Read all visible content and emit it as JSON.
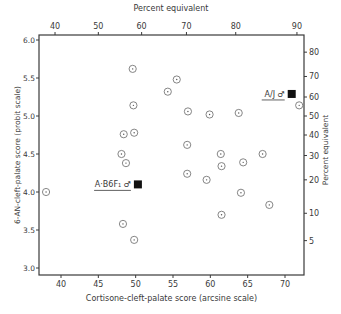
{
  "chart_data": {
    "type": "scatter",
    "title": "",
    "xlabel": "Cortisone-cleft-palate score (arcsine scale)",
    "ylabel": "6-AN-cleft-palate score (probit scale)",
    "top_xlabel": "Percent equivalent",
    "right_ylabel": "Percent equivalent",
    "xlim": [
      37,
      73
    ],
    "ylim": [
      2.9,
      6.1
    ],
    "x_ticks": [
      40,
      45,
      50,
      55,
      60,
      65,
      70
    ],
    "x_tick_labels": [
      "40",
      "45",
      "50",
      "55",
      "60",
      "65",
      "70"
    ],
    "y_ticks": [
      3.0,
      3.5,
      4.0,
      4.5,
      5.0,
      5.5,
      6.0
    ],
    "y_tick_labels": [
      "3.0",
      "3.5",
      "4.0",
      "4.5",
      "5.0",
      "5.5",
      "6.0"
    ],
    "top_ticks": [
      {
        "label": "40",
        "x": 39.2
      },
      {
        "label": "50",
        "x": 45.0
      },
      {
        "label": "60",
        "x": 50.8
      },
      {
        "label": "70",
        "x": 56.8
      },
      {
        "label": "80",
        "x": 63.4
      },
      {
        "label": "90",
        "x": 71.6
      }
    ],
    "right_ticks": [
      {
        "label": "80",
        "y": 5.84
      },
      {
        "label": "70",
        "y": 5.52
      },
      {
        "label": "60",
        "y": 5.25
      },
      {
        "label": "50",
        "y": 5.0
      },
      {
        "label": "40",
        "y": 4.75
      },
      {
        "label": "30",
        "y": 4.48
      },
      {
        "label": "20",
        "y": 4.16
      },
      {
        "label": "10",
        "y": 3.72
      },
      {
        "label": "5",
        "y": 3.36
      }
    ],
    "grid": false,
    "legend": null,
    "series": [
      {
        "name": "strains",
        "marker": "circle-dot",
        "points": [
          {
            "x": 38.0,
            "y": 4.0
          },
          {
            "x": 49.6,
            "y": 5.62
          },
          {
            "x": 55.5,
            "y": 5.48
          },
          {
            "x": 54.3,
            "y": 5.32
          },
          {
            "x": 48.4,
            "y": 4.76
          },
          {
            "x": 49.8,
            "y": 4.78
          },
          {
            "x": 48.1,
            "y": 4.5
          },
          {
            "x": 48.7,
            "y": 4.38
          },
          {
            "x": 49.7,
            "y": 5.14
          },
          {
            "x": 57.0,
            "y": 5.06
          },
          {
            "x": 59.9,
            "y": 5.02
          },
          {
            "x": 63.8,
            "y": 5.04
          },
          {
            "x": 71.9,
            "y": 5.14
          },
          {
            "x": 56.9,
            "y": 4.62
          },
          {
            "x": 61.4,
            "y": 4.5
          },
          {
            "x": 61.5,
            "y": 4.34
          },
          {
            "x": 64.4,
            "y": 4.39
          },
          {
            "x": 67.0,
            "y": 4.5
          },
          {
            "x": 56.9,
            "y": 4.24
          },
          {
            "x": 59.5,
            "y": 4.16
          },
          {
            "x": 64.1,
            "y": 3.99
          },
          {
            "x": 67.9,
            "y": 3.83
          },
          {
            "x": 61.5,
            "y": 3.7
          },
          {
            "x": 48.3,
            "y": 3.58
          },
          {
            "x": 49.8,
            "y": 3.37
          }
        ]
      },
      {
        "name": "parental strains",
        "marker": "filled-square",
        "points": [
          {
            "x": 50.3,
            "y": 4.1,
            "label": "A·B6F₁ ♂"
          },
          {
            "x": 70.9,
            "y": 5.29,
            "label": "A/J ♂"
          }
        ]
      }
    ]
  },
  "annotations": {
    "ab6f1": "A·B6F₁ ♂",
    "aj": "A/J ♂"
  }
}
